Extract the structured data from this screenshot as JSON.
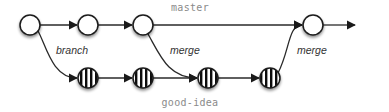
{
  "diagram": {
    "title": "",
    "branches": [
      {
        "id": "master",
        "label": "master",
        "label_x": 190,
        "label_y": 11,
        "y": 25
      },
      {
        "id": "good-idea",
        "label": "good-idea",
        "label_x": 190,
        "label_y": 106,
        "y": 78
      }
    ],
    "edge_labels": {
      "branch": "branch",
      "merge1": "merge",
      "merge2": "merge"
    },
    "nodes": [
      {
        "id": "m1",
        "branch": "master",
        "x": 30,
        "y": 25,
        "style": "plain"
      },
      {
        "id": "m2",
        "branch": "master",
        "x": 88,
        "y": 25,
        "style": "plain"
      },
      {
        "id": "m3",
        "branch": "master",
        "x": 143,
        "y": 25,
        "style": "plain"
      },
      {
        "id": "m4",
        "branch": "master",
        "x": 313,
        "y": 25,
        "style": "plain"
      },
      {
        "id": "g1",
        "branch": "good-idea",
        "x": 88,
        "y": 78,
        "style": "striped"
      },
      {
        "id": "g2",
        "branch": "good-idea",
        "x": 143,
        "y": 78,
        "style": "striped"
      },
      {
        "id": "g3",
        "branch": "good-idea",
        "x": 208,
        "y": 78,
        "style": "striped"
      },
      {
        "id": "g4",
        "branch": "good-idea",
        "x": 270,
        "y": 78,
        "style": "striped"
      }
    ],
    "edges": [
      {
        "from": "m1",
        "to": "m2",
        "type": "straight"
      },
      {
        "from": "m2",
        "to": "m3",
        "type": "straight"
      },
      {
        "from": "m3",
        "to": "m4",
        "type": "straight"
      },
      {
        "from": "m4",
        "to": "end",
        "type": "straight"
      },
      {
        "from": "m1",
        "to": "g1",
        "type": "curve",
        "label": "branch"
      },
      {
        "from": "g1",
        "to": "g2",
        "type": "straight"
      },
      {
        "from": "g2",
        "to": "g3",
        "type": "straight"
      },
      {
        "from": "m3",
        "to": "g3",
        "type": "curve",
        "label": "merge"
      },
      {
        "from": "g3",
        "to": "g4",
        "type": "straight"
      },
      {
        "from": "g4",
        "to": "m4",
        "type": "curve",
        "label": "merge"
      }
    ],
    "colors": {
      "node_stroke": "#1a1a1a",
      "edge": "#2a2a2a",
      "branch_label": "#8a8a8a",
      "edge_label": "#333333",
      "background": "#ffffff"
    }
  }
}
